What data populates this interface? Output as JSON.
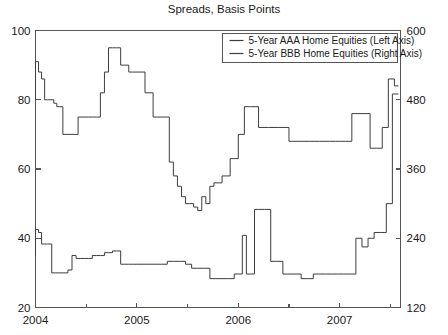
{
  "chart_data": {
    "type": "line",
    "title": "Spreads, Basis Points",
    "xlabel": "",
    "ylabel": "",
    "grid": false,
    "legend_position": "top-right",
    "x_axis": {
      "min": 2004.0,
      "max": 2007.6,
      "major_ticks": [
        2004,
        2005,
        2006,
        2007
      ],
      "major_tick_labels": [
        "2004",
        "2005",
        "2006",
        "2007"
      ],
      "minor_ticks": [
        2004.5,
        2005.5,
        2006.5,
        2007.5
      ]
    },
    "y_axis_left": {
      "label": "",
      "min": 20,
      "max": 100,
      "ticks": [
        20,
        40,
        60,
        80,
        100
      ],
      "tick_labels": [
        "20",
        "40",
        "60",
        "80",
        "100"
      ]
    },
    "y_axis_right": {
      "label": "",
      "min": 120,
      "max": 600,
      "ticks": [
        120,
        240,
        360,
        480,
        600
      ],
      "tick_labels": [
        "120",
        "240",
        "360",
        "480",
        "600"
      ]
    },
    "series": [
      {
        "name": "5-Year AAA Home Equities (Left Axis)",
        "axis": "left",
        "color": "#3d3d3d",
        "x": [
          2004.0,
          2004.03,
          2004.06,
          2004.09,
          2004.12,
          2004.15,
          2004.18,
          2004.21,
          2004.24,
          2004.27,
          2004.3,
          2004.33,
          2004.36,
          2004.39,
          2004.42,
          2004.45,
          2004.48,
          2004.52,
          2004.56,
          2004.6,
          2004.64,
          2004.68,
          2004.72,
          2004.76,
          2004.8,
          2004.84,
          2004.88,
          2004.92,
          2004.96,
          2005.0,
          2005.04,
          2005.08,
          2005.12,
          2005.16,
          2005.2,
          2005.24,
          2005.28,
          2005.32,
          2005.36,
          2005.4,
          2005.44,
          2005.48,
          2005.52,
          2005.56,
          2005.6,
          2005.64,
          2005.68,
          2005.72,
          2005.76,
          2005.8,
          2005.84,
          2005.88,
          2005.92,
          2005.96,
          2006.0,
          2006.06,
          2006.12,
          2006.2,
          2006.3,
          2006.4,
          2006.5,
          2006.6,
          2006.7,
          2006.8,
          2006.9,
          2006.96,
          2007.0,
          2007.06,
          2007.12,
          2007.18,
          2007.24,
          2007.3,
          2007.36,
          2007.42,
          2007.48,
          2007.54,
          2007.58
        ],
        "y": [
          80,
          91,
          88,
          86,
          80,
          80,
          80,
          79,
          78,
          78,
          70,
          70,
          70,
          70,
          70,
          75,
          75,
          75,
          75,
          75,
          75,
          82,
          88,
          95,
          95,
          95,
          90,
          90,
          88,
          88,
          88,
          88,
          82,
          82,
          75,
          75,
          75,
          75,
          62,
          58,
          55,
          52,
          50,
          50,
          49,
          48,
          52,
          50,
          55,
          56,
          56,
          58,
          58,
          63,
          63,
          70,
          78,
          78,
          72,
          72,
          72,
          68,
          68,
          68,
          68,
          68,
          68,
          68,
          68,
          76,
          76,
          76,
          66,
          66,
          72,
          86,
          84
        ]
      },
      {
        "name": "5-Year BBB Home Equities (Right Axis)",
        "axis": "right",
        "color": "#3d3d3d",
        "x": [
          2004.0,
          2004.03,
          2004.06,
          2004.09,
          2004.12,
          2004.16,
          2004.2,
          2004.24,
          2004.28,
          2004.32,
          2004.36,
          2004.4,
          2004.44,
          2004.48,
          2004.52,
          2004.56,
          2004.6,
          2004.64,
          2004.68,
          2004.72,
          2004.76,
          2004.8,
          2004.84,
          2004.88,
          2004.92,
          2004.96,
          2005.0,
          2005.06,
          2005.12,
          2005.18,
          2005.24,
          2005.3,
          2005.36,
          2005.42,
          2005.48,
          2005.54,
          2005.6,
          2005.66,
          2005.72,
          2005.78,
          2005.84,
          2005.9,
          2005.96,
          2006.0,
          2006.04,
          2006.08,
          2006.12,
          2006.16,
          2006.2,
          2006.26,
          2006.32,
          2006.38,
          2006.44,
          2006.5,
          2006.56,
          2006.62,
          2006.68,
          2006.74,
          2006.8,
          2006.86,
          2006.92,
          2006.98,
          2007.04,
          2007.1,
          2007.16,
          2007.22,
          2007.28,
          2007.34,
          2007.4,
          2007.46,
          2007.52,
          2007.58
        ],
        "y": [
          210,
          255,
          250,
          230,
          230,
          230,
          180,
          180,
          180,
          180,
          185,
          210,
          205,
          205,
          205,
          205,
          210,
          210,
          210,
          215,
          215,
          218,
          218,
          195,
          195,
          195,
          195,
          195,
          195,
          195,
          195,
          195,
          200,
          200,
          200,
          195,
          188,
          188,
          188,
          170,
          170,
          170,
          170,
          178,
          178,
          245,
          178,
          178,
          290,
          290,
          290,
          200,
          200,
          178,
          178,
          178,
          170,
          170,
          178,
          178,
          178,
          178,
          178,
          178,
          178,
          240,
          225,
          240,
          250,
          250,
          300,
          490
        ]
      }
    ]
  },
  "legend": {
    "entries": [
      {
        "label": "5-Year AAA Home Equities (Left Axis)"
      },
      {
        "label": "5-Year BBB Home Equities (Right Axis)"
      }
    ]
  }
}
